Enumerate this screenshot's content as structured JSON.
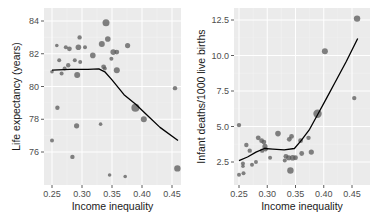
{
  "chart_data": [
    {
      "type": "scatter",
      "title": "",
      "xlabel": "Income inequality",
      "ylabel": "Life expectancy (years)",
      "xlim": [
        0.24,
        0.465
      ],
      "ylim": [
        74.3,
        84.6
      ],
      "xticks": [
        0.25,
        0.3,
        0.35,
        0.4,
        0.45
      ],
      "xtick_labels": [
        "0.25",
        "0.30",
        "0.35",
        "0.40",
        "0.45"
      ],
      "yticks": [
        76,
        78,
        80,
        82,
        84
      ],
      "ytick_labels": [
        "76",
        "78",
        "80",
        "82",
        "84"
      ],
      "grid": true,
      "points": [
        {
          "x": 0.34,
          "y": 83.9,
          "s": 3.5
        },
        {
          "x": 0.296,
          "y": 83.0,
          "s": 2.2
        },
        {
          "x": 0.258,
          "y": 82.5,
          "s": 1.8
        },
        {
          "x": 0.273,
          "y": 82.4,
          "s": 2.0
        },
        {
          "x": 0.279,
          "y": 82.3,
          "s": 2.4
        },
        {
          "x": 0.294,
          "y": 82.4,
          "s": 2.8
        },
        {
          "x": 0.305,
          "y": 82.4,
          "s": 2.0
        },
        {
          "x": 0.333,
          "y": 82.6,
          "s": 3.0
        },
        {
          "x": 0.343,
          "y": 82.9,
          "s": 2.8
        },
        {
          "x": 0.376,
          "y": 82.5,
          "s": 2.6
        },
        {
          "x": 0.352,
          "y": 82.1,
          "s": 2.8
        },
        {
          "x": 0.358,
          "y": 82.1,
          "s": 2.4
        },
        {
          "x": 0.318,
          "y": 81.9,
          "s": 2.8
        },
        {
          "x": 0.262,
          "y": 81.6,
          "s": 2.0
        },
        {
          "x": 0.288,
          "y": 81.6,
          "s": 2.0
        },
        {
          "x": 0.297,
          "y": 81.5,
          "s": 2.0
        },
        {
          "x": 0.349,
          "y": 81.7,
          "s": 2.0
        },
        {
          "x": 0.277,
          "y": 81.3,
          "s": 2.2
        },
        {
          "x": 0.271,
          "y": 81.1,
          "s": 2.0
        },
        {
          "x": 0.336,
          "y": 81.2,
          "s": 2.4
        },
        {
          "x": 0.338,
          "y": 81.1,
          "s": 2.0
        },
        {
          "x": 0.358,
          "y": 81.0,
          "s": 3.0
        },
        {
          "x": 0.25,
          "y": 80.9,
          "s": 1.8
        },
        {
          "x": 0.266,
          "y": 80.8,
          "s": 2.0
        },
        {
          "x": 0.292,
          "y": 80.7,
          "s": 3.0
        },
        {
          "x": 0.455,
          "y": 79.9,
          "s": 2.2
        },
        {
          "x": 0.389,
          "y": 78.7,
          "s": 4.0
        },
        {
          "x": 0.259,
          "y": 78.7,
          "s": 2.2
        },
        {
          "x": 0.403,
          "y": 78.0,
          "s": 3.0
        },
        {
          "x": 0.331,
          "y": 77.7,
          "s": 1.8
        },
        {
          "x": 0.291,
          "y": 77.6,
          "s": 2.6
        },
        {
          "x": 0.25,
          "y": 76.7,
          "s": 2.0
        },
        {
          "x": 0.284,
          "y": 75.7,
          "s": 2.2
        },
        {
          "x": 0.459,
          "y": 75.0,
          "s": 3.2
        },
        {
          "x": 0.346,
          "y": 74.6,
          "s": 1.8
        },
        {
          "x": 0.372,
          "y": 74.5,
          "s": 1.8
        }
      ],
      "smooth_line": [
        {
          "x": 0.25,
          "y": 81.0
        },
        {
          "x": 0.28,
          "y": 81.05
        },
        {
          "x": 0.31,
          "y": 81.05
        },
        {
          "x": 0.328,
          "y": 81.08
        },
        {
          "x": 0.338,
          "y": 80.9
        },
        {
          "x": 0.35,
          "y": 80.4
        },
        {
          "x": 0.37,
          "y": 79.5
        },
        {
          "x": 0.39,
          "y": 78.9
        },
        {
          "x": 0.41,
          "y": 78.2
        },
        {
          "x": 0.43,
          "y": 77.5
        },
        {
          "x": 0.46,
          "y": 76.7
        }
      ]
    },
    {
      "type": "scatter",
      "title": "",
      "xlabel": "Income inequality",
      "ylabel": "Infant deaths/1000 live births",
      "xlim": [
        0.24,
        0.465
      ],
      "ylim": [
        1.2,
        13.2
      ],
      "xticks": [
        0.25,
        0.3,
        0.35,
        0.4,
        0.45
      ],
      "xtick_labels": [
        "0.25",
        "0.30",
        "0.35",
        "0.40",
        "0.45"
      ],
      "yticks": [
        2.5,
        5.0,
        7.5,
        10.0,
        12.5
      ],
      "ytick_labels": [
        "2.5 ",
        "5.0",
        "7.5",
        "10.0",
        "12.5"
      ],
      "grid": true,
      "points": [
        {
          "x": 0.459,
          "y": 12.6,
          "s": 3.2
        },
        {
          "x": 0.402,
          "y": 10.3,
          "s": 3.0
        },
        {
          "x": 0.454,
          "y": 7.0,
          "s": 2.2
        },
        {
          "x": 0.389,
          "y": 5.9,
          "s": 4.2
        },
        {
          "x": 0.25,
          "y": 5.1,
          "s": 2.2
        },
        {
          "x": 0.319,
          "y": 4.5,
          "s": 2.8
        },
        {
          "x": 0.343,
          "y": 4.3,
          "s": 2.4
        },
        {
          "x": 0.339,
          "y": 4.1,
          "s": 2.4
        },
        {
          "x": 0.373,
          "y": 4.2,
          "s": 2.2
        },
        {
          "x": 0.284,
          "y": 4.2,
          "s": 2.4
        },
        {
          "x": 0.29,
          "y": 4.0,
          "s": 2.4
        },
        {
          "x": 0.294,
          "y": 3.9,
          "s": 2.4
        },
        {
          "x": 0.296,
          "y": 3.6,
          "s": 2.6
        },
        {
          "x": 0.263,
          "y": 3.7,
          "s": 2.2
        },
        {
          "x": 0.269,
          "y": 3.3,
          "s": 2.2
        },
        {
          "x": 0.291,
          "y": 3.3,
          "s": 2.2
        },
        {
          "x": 0.297,
          "y": 3.4,
          "s": 2.2
        },
        {
          "x": 0.359,
          "y": 4.0,
          "s": 2.4
        },
        {
          "x": 0.361,
          "y": 3.1,
          "s": 2.4
        },
        {
          "x": 0.378,
          "y": 3.2,
          "s": 2.6
        },
        {
          "x": 0.333,
          "y": 2.9,
          "s": 2.4
        },
        {
          "x": 0.338,
          "y": 2.8,
          "s": 2.6
        },
        {
          "x": 0.345,
          "y": 2.8,
          "s": 2.8
        },
        {
          "x": 0.35,
          "y": 2.8,
          "s": 2.4
        },
        {
          "x": 0.305,
          "y": 2.8,
          "s": 2.0
        },
        {
          "x": 0.331,
          "y": 2.6,
          "s": 2.0
        },
        {
          "x": 0.28,
          "y": 2.5,
          "s": 2.0
        },
        {
          "x": 0.273,
          "y": 2.3,
          "s": 2.0
        },
        {
          "x": 0.257,
          "y": 2.4,
          "s": 2.0
        },
        {
          "x": 0.257,
          "y": 2.2,
          "s": 1.8
        },
        {
          "x": 0.341,
          "y": 1.9,
          "s": 3.2
        },
        {
          "x": 0.25,
          "y": 1.6,
          "s": 2.0
        },
        {
          "x": 0.258,
          "y": 1.7,
          "s": 2.0
        }
      ],
      "smooth_line": [
        {
          "x": 0.25,
          "y": 2.6
        },
        {
          "x": 0.265,
          "y": 2.85
        },
        {
          "x": 0.28,
          "y": 3.2
        },
        {
          "x": 0.295,
          "y": 3.45
        },
        {
          "x": 0.31,
          "y": 3.4
        },
        {
          "x": 0.33,
          "y": 3.35
        },
        {
          "x": 0.348,
          "y": 3.45
        },
        {
          "x": 0.36,
          "y": 4.0
        },
        {
          "x": 0.375,
          "y": 4.8
        },
        {
          "x": 0.39,
          "y": 5.9
        },
        {
          "x": 0.405,
          "y": 7.0
        },
        {
          "x": 0.42,
          "y": 8.1
        },
        {
          "x": 0.44,
          "y": 9.6
        },
        {
          "x": 0.46,
          "y": 11.2
        }
      ]
    }
  ],
  "layout": {
    "panels": [
      {
        "left": 44,
        "top": 8,
        "width": 137,
        "height": 177,
        "x0": 52,
        "x1": 172,
        "y_at_first_tick": 152,
        "y_at_last_tick": 21
      },
      {
        "left": 234,
        "top": 8,
        "width": 136,
        "height": 177,
        "x0": 239,
        "x1": 352,
        "y_at_first_tick": 162,
        "y_at_last_tick": 20
      }
    ],
    "colors": {
      "panel_bg": "#ebebeb",
      "grid_major": "#ffffff",
      "grid_minor": "#f2f2f2",
      "point_fill": "#595959",
      "point_opacity": 0.75,
      "line": "#000000",
      "tick": "#333333"
    }
  }
}
